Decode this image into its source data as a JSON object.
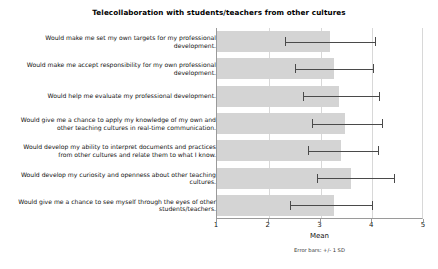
{
  "chart_data": {
    "type": "bar",
    "orientation": "horizontal",
    "title": "Telecollaboration with students/teachers from other cultures",
    "xlabel": "Mean",
    "ylabel": "",
    "xlim": [
      1,
      5
    ],
    "xticks": [
      "1",
      "2",
      "3",
      "4",
      "5"
    ],
    "grid": true,
    "legend": false,
    "annotation": "Error bars: +/- 1 SD",
    "bar_color": "#d4d4d4",
    "error_color": "#4a4a4a",
    "categories": [
      "Would make me set my own targets for my professional development.",
      "Would make me accept responsibility for my own professional development.",
      "Would help me evaluate my professional development.",
      "Would give me a chance to apply my knowledge of my own and other teaching cultures in real-time communication.",
      "Would develop my ability to interpret documents and practices from other cultures and relate them to what I know.",
      "Would develop my curiosity and openness about other teaching cultures.",
      "Would give me a chance to see myself through the eyes of other students/teachers."
    ],
    "values": [
      3.18,
      3.26,
      3.36,
      3.47,
      3.4,
      3.59,
      3.26
    ],
    "error_low": [
      2.32,
      2.5,
      2.67,
      2.83,
      2.75,
      2.93,
      2.42
    ],
    "error_high": [
      4.05,
      4.02,
      4.13,
      4.18,
      4.12,
      4.42,
      4.0
    ]
  }
}
